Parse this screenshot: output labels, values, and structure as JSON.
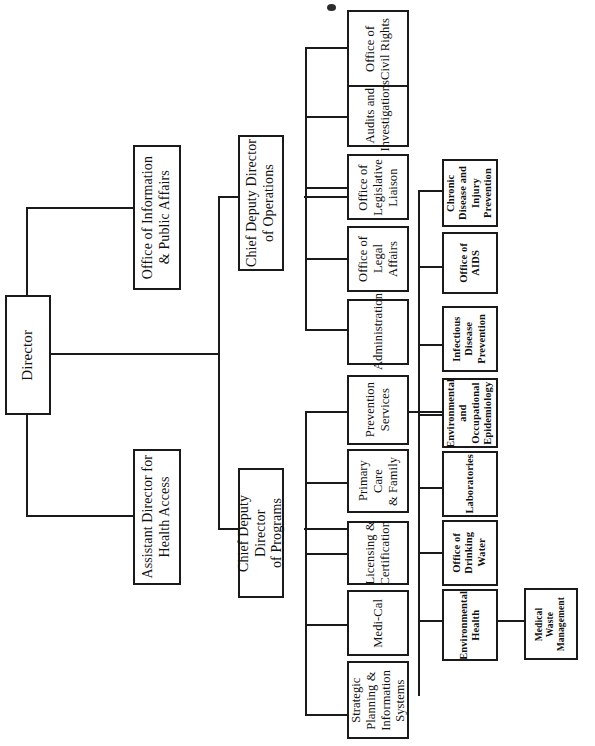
{
  "document": {
    "kind": "organization-chart",
    "orientation": "rotated-90-counterclockwise",
    "page_background": "#ffffff",
    "line_color": "#1a1a1a"
  },
  "nodes": {
    "director": "Director",
    "office_info_public_affairs": "Office of Information\n& Public Affairs",
    "assistant_director_health_access": "Assistant Director for\nHealth Access",
    "chief_deputy_operations": "Chief Deputy Director\nof Operations",
    "chief_deputy_programs": "Chief Deputy Director\nof Programs",
    "office_civil_rights": "Office of\nCivil Rights",
    "audits_investigations": "Audits and\nInvestigations",
    "office_legislative_liaison": "Office of\nLegislative\nLiaison",
    "office_legal_affairs": "Office of\nLegal Affairs",
    "administration": "Administration",
    "prevention_services": "Prevention\nServices",
    "primary_care_family": "Primary Care\n& Family",
    "licensing_certification": "Licensing &\nCertification",
    "medi_cal": "Medi-Cal",
    "strategic_planning_info_systems": "Strategic\nPlanning &\nInformation\nSystems",
    "chronic_disease_injury_prevention": "Chronic\nDisease and\nInjury\nPrevention",
    "office_of_aids": "Office of\nAIDS",
    "infectious_disease_prevention": "Infectious\nDisease\nPrevention",
    "environmental_occupational_epidemiology": "Environmental\nand\nOccupational\nEpidemiology",
    "laboratories": "Laboratories",
    "office_drinking_water": "Office of\nDrinking\nWater",
    "environmental_health": "Environmental\nHealth",
    "medical_waste_management": "Medical\nWaste\nManagement"
  }
}
